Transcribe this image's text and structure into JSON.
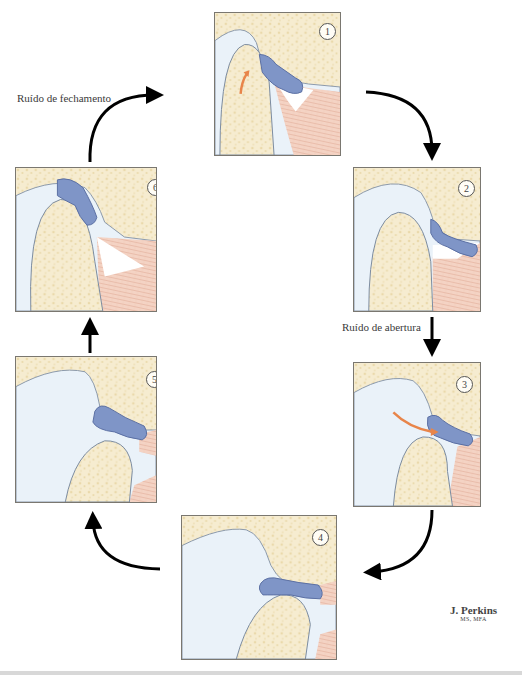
{
  "diagram": {
    "title": "",
    "labels": {
      "closing_noise": "Ruído de fechamento",
      "opening_noise": "Ruído de abertura"
    },
    "panels": [
      {
        "id": 1,
        "number": "1",
        "stage": "closed mouth, disc anteriorly displaced"
      },
      {
        "id": 2,
        "number": "2",
        "stage": "beginning of opening"
      },
      {
        "id": 3,
        "number": "3",
        "stage": "condyle reduces onto disc (opening click)"
      },
      {
        "id": 4,
        "number": "4",
        "stage": "full opening, disc reduced"
      },
      {
        "id": 5,
        "number": "5",
        "stage": "beginning of closing"
      },
      {
        "id": 6,
        "number": "6",
        "stage": "disc displaces anteriorly (closing click)"
      }
    ],
    "cycle_order": [
      "1",
      "2",
      "3",
      "4",
      "5",
      "6"
    ],
    "signature": {
      "name": "J. Perkins",
      "degree": "MS, MFA"
    },
    "colors": {
      "bone": "#f6ecd0",
      "bone_dots": "#e8d6a8",
      "disc": "#7f95c7",
      "disc_edge": "#5a6fa3",
      "synovial": "#e6f0f8",
      "muscle": "#f3cdbd",
      "muscle_lines": "#d99f8a",
      "motion_arrow": "#e8854a",
      "flow_arrow": "#000000"
    }
  }
}
